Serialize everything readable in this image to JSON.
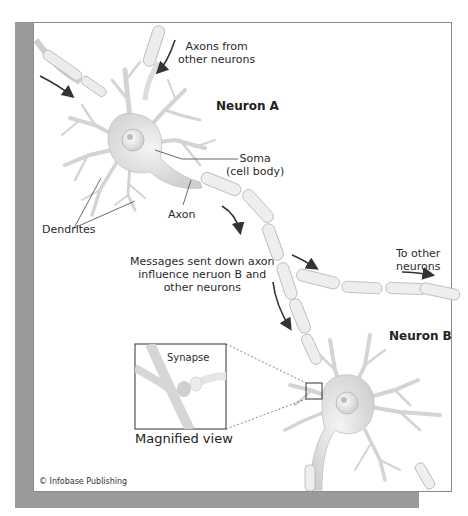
{
  "figure": {
    "colors": {
      "neuron_fill": "#d9d9d9",
      "neuron_stroke": "#bdbdbd",
      "arrow": "#333333",
      "frame_shadow": "#9a9a9a",
      "leader_line": "#444444"
    },
    "labels": {
      "axons_from_line1": "Axons from",
      "axons_from_line2": "other neurons",
      "neuron_a": "Neuron A",
      "soma_line1": "Soma",
      "soma_line2": "(cell body)",
      "axon": "Axon",
      "dendrites": "Dendrites",
      "messages_line1": "Messages sent down axon",
      "messages_line2": "influence neruon B and",
      "messages_line3": "other neurons",
      "to_other_line1": "To other",
      "to_other_line2": "neurons",
      "neuron_b": "Neuron B",
      "synapse": "Synapse",
      "magnified_view": "Magnified view",
      "copyright": "© Infobase Publishing"
    }
  }
}
